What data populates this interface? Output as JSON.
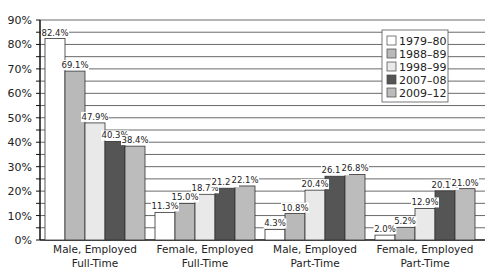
{
  "chart_data": {
    "type": "bar",
    "title": "",
    "xlabel": "",
    "ylabel": "",
    "ylim": [
      0,
      90
    ],
    "yticks": [
      "0%",
      "10%",
      "20%",
      "30%",
      "40%",
      "50%",
      "60%",
      "70%",
      "80%",
      "90%"
    ],
    "grid": true,
    "legend_position": "upper right",
    "categories": [
      [
        "Male, Employed",
        "Full-Time"
      ],
      [
        "Female, Employed",
        "Full-Time"
      ],
      [
        "Male, Employed",
        "Part-Time"
      ],
      [
        "Female, Employed",
        "Part-Time"
      ]
    ],
    "series": [
      {
        "name": "1979–80",
        "color": "#ffffff",
        "values": [
          82.4,
          11.3,
          4.3,
          2.0
        ],
        "labels": [
          "82.4%",
          "11.3%",
          "4.3%",
          "2.0%"
        ]
      },
      {
        "name": "1988–89",
        "color": "#b9b9b9",
        "values": [
          69.1,
          15.0,
          10.8,
          5.2
        ],
        "labels": [
          "69.1%",
          "15.0%",
          "10.8%",
          "5.2%"
        ]
      },
      {
        "name": "1998–99",
        "color": "#e9e9e9",
        "values": [
          47.9,
          18.7,
          20.4,
          12.9
        ],
        "labels": [
          "47.9%",
          "18.7%",
          "20.4%",
          "12.9%"
        ]
      },
      {
        "name": "2007–08",
        "color": "#555555",
        "values": [
          40.3,
          21.2,
          26.1,
          20.1
        ],
        "labels": [
          "40.3%",
          "21.2%",
          "26.1%",
          "20.1%"
        ]
      },
      {
        "name": "2009–12",
        "color": "#bcbcbc",
        "values": [
          38.4,
          22.1,
          26.8,
          21.0
        ],
        "labels": [
          "38.4%",
          "22.1%",
          "26.8%",
          "21.0%"
        ]
      }
    ]
  }
}
